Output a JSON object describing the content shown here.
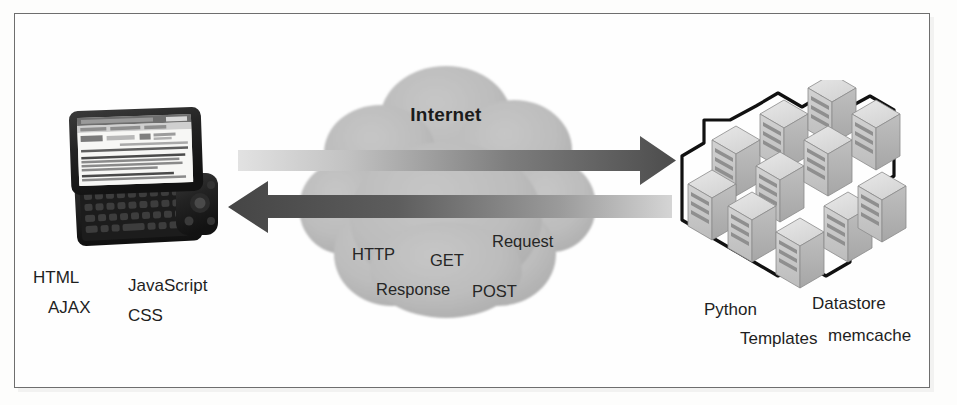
{
  "figure": {
    "background_color": "#fdfdfc",
    "frame_color": "#6e6e6e"
  },
  "cloud": {
    "name": "Internet",
    "label": "Internet",
    "fill_color": "#b8b8b8",
    "terms": [
      {
        "key": "http",
        "text": "HTTP"
      },
      {
        "key": "get",
        "text": "GET"
      },
      {
        "key": "request",
        "text": "Request"
      },
      {
        "key": "response",
        "text": "Response"
      },
      {
        "key": "post",
        "text": "POST"
      }
    ]
  },
  "arrows": [
    {
      "key": "request_arrow",
      "direction": "right",
      "meaning": "client to server request",
      "color_start": "#d9d9d9",
      "color_end": "#4a4a4a"
    },
    {
      "key": "response_arrow",
      "direction": "left",
      "meaning": "server to client response",
      "color_start": "#4a4a4a",
      "color_end": "#d0d0d0"
    }
  ],
  "client": {
    "device": "slider-smartphone",
    "screen_content": "mobile web browser showing search results",
    "labels": [
      {
        "key": "html",
        "text": "HTML"
      },
      {
        "key": "javascript",
        "text": "JavaScript"
      },
      {
        "key": "ajax",
        "text": "AJAX"
      },
      {
        "key": "css",
        "text": "CSS"
      }
    ]
  },
  "server": {
    "device": "server-rack-cluster",
    "rack_rows": 3,
    "rack_cols": 3,
    "labels": [
      {
        "key": "python",
        "text": "Python"
      },
      {
        "key": "datastore",
        "text": "Datastore"
      },
      {
        "key": "templates",
        "text": "Templates"
      },
      {
        "key": "memcache",
        "text": "memcache"
      }
    ]
  }
}
